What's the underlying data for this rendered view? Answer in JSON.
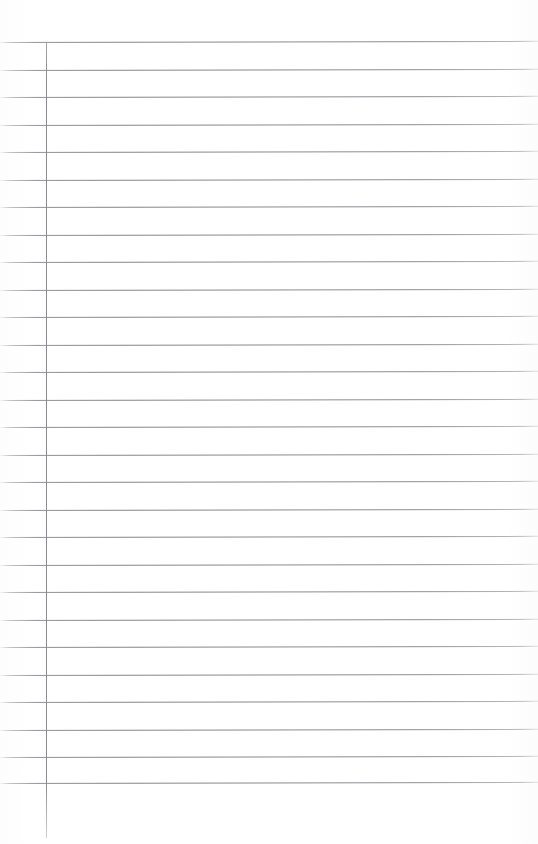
{
  "document": {
    "title": "Blank Lined Paper",
    "kind": "scanned-lined-notebook-page",
    "content_text": "",
    "is_blank": true
  },
  "page": {
    "width": 538,
    "height": 844,
    "background_color": "#ffffff"
  },
  "ruling": {
    "line_color": "#8a8a92",
    "line_thickness_px": 1,
    "line_spacing_px": 27.5,
    "first_line_y": 42,
    "last_line_y": 783,
    "line_count": 28,
    "line_start_x": 0,
    "line_end_x": 538,
    "skew_degrees": -0.12,
    "horizontal_line_y_positions": [
      42,
      69.5,
      97,
      124.5,
      152,
      179.5,
      207,
      234.5,
      262,
      289.5,
      317,
      344.5,
      372,
      399.5,
      427,
      454.5,
      482,
      509.5,
      537,
      564.5,
      592,
      619.5,
      647,
      674.5,
      702,
      729.5,
      757,
      783
    ]
  },
  "margin_rule": {
    "color": "#8a8a92",
    "thickness_px": 1,
    "x": 46,
    "top_y": 42,
    "bottom_y": 838,
    "orientation": "vertical"
  }
}
